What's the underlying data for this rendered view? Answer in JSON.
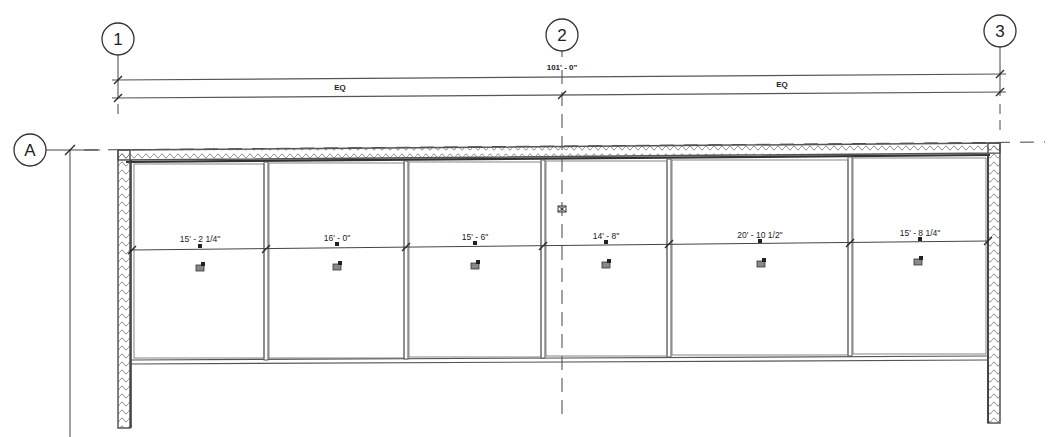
{
  "drawing": {
    "type": "floor-plan",
    "line_color": "#444444",
    "wall_color": "#555555",
    "background": "#ffffff"
  },
  "grids": {
    "vertical": [
      {
        "label": "1",
        "x": 118
      },
      {
        "label": "2",
        "x": 562
      },
      {
        "label": "3",
        "x": 1000
      }
    ],
    "horizontal": [
      {
        "label": "A",
        "y": 150
      }
    ]
  },
  "dimensions": {
    "overall": {
      "text": "101' - 0\"",
      "from": "1",
      "to": "3"
    },
    "segments": [
      {
        "text": "EQ",
        "from": "1",
        "to": "2"
      },
      {
        "text": "EQ",
        "from": "2",
        "to": "3"
      }
    ]
  },
  "rooms": [
    {
      "width_dim": "15' - 2 1/4\"",
      "x1": 133,
      "x2": 265
    },
    {
      "width_dim": "16' - 0\"",
      "x1": 268,
      "x2": 405
    },
    {
      "width_dim": "15' - 6\"",
      "x1": 408,
      "x2": 541
    },
    {
      "width_dim": "14' - 8\"",
      "x1": 544,
      "x2": 668
    },
    {
      "width_dim": "20' - 10 1/2\"",
      "x1": 671,
      "x2": 848
    },
    {
      "width_dim": "15' - 8 1/4\"",
      "x1": 851,
      "x2": 987
    }
  ],
  "icons": {
    "room_tag": "room-tag-icon",
    "grid_marker": "grid-marker-icon"
  }
}
